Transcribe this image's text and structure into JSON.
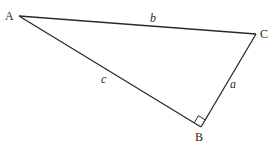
{
  "diagram": {
    "type": "right-triangle",
    "right_angle_at": "B",
    "colors": {
      "line": "#2a2a2a",
      "background": "#ffffff"
    },
    "vertices": {
      "A": {
        "label": "A",
        "x": 19,
        "y": 16
      },
      "B": {
        "label": "B",
        "x": 201,
        "y": 127
      },
      "C": {
        "label": "C",
        "x": 256,
        "y": 34
      }
    },
    "sides": {
      "a": {
        "label": "a",
        "from": "B",
        "to": "C"
      },
      "b": {
        "label": "b",
        "from": "A",
        "to": "C"
      },
      "c": {
        "label": "c",
        "from": "A",
        "to": "B"
      }
    }
  }
}
